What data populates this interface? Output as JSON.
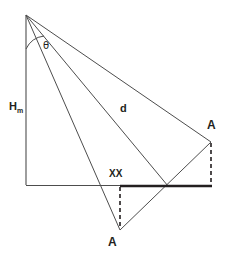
{
  "diagram": {
    "stroke_color": "#4d4d4d",
    "bold_stroke_color": "#231f20",
    "background_color": "#ffffff",
    "labels": {
      "theta": "θ",
      "height_symbol": "H",
      "height_subscript": "m",
      "distance": "d",
      "point_right": "A",
      "point_bottom": "A",
      "segment": "XX"
    },
    "points": {
      "apex": {
        "x": 26,
        "y": 15
      },
      "base_left": {
        "x": 26,
        "y": 185
      },
      "segment_start": {
        "x": 120,
        "y": 186
      },
      "crossing": {
        "x": 168,
        "y": 186
      },
      "segment_end": {
        "x": 212,
        "y": 186
      },
      "point_a_right": {
        "x": 211,
        "y": 142
      },
      "point_a_bottom": {
        "x": 120,
        "y": 230
      }
    },
    "elements": [
      {
        "name": "vertical-height-line",
        "type": "solid"
      },
      {
        "name": "horizontal-baseline",
        "type": "solid"
      },
      {
        "name": "ray-to-bottom-a",
        "type": "solid"
      },
      {
        "name": "ray-distance-d",
        "type": "solid"
      },
      {
        "name": "ray-to-right-a",
        "type": "solid"
      },
      {
        "name": "chord-bottom-a-to-right-a",
        "type": "solid"
      },
      {
        "name": "segment-xx",
        "type": "bold"
      },
      {
        "name": "dashed-drop-right",
        "type": "dashed"
      },
      {
        "name": "dashed-drop-bottom",
        "type": "dashed"
      },
      {
        "name": "theta-arc",
        "type": "arc"
      }
    ]
  }
}
